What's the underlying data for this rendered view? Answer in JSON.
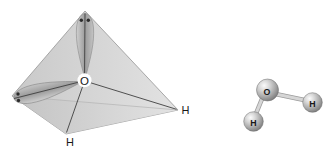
{
  "figure": {
    "description_labels": {
      "tetrahedral_model": {
        "oxygen_label": "O",
        "hydrogen_bottom_label": "H",
        "hydrogen_right_label": "H"
      },
      "ball_and_stick_model": {
        "oxygen_label": "O",
        "hydrogen_left_label": "H",
        "hydrogen_right_label": "H"
      }
    },
    "colors": {
      "background": "#ffffff",
      "face_left": "#c9c9c9",
      "face_right": "#e2e2e2",
      "face_lower_left": "#c2c2c2",
      "face_lower_right": "#e3e3e3",
      "edge": "#969696",
      "back_edge": "#b3b3b3",
      "bond_line": "#3f3f3f",
      "lobe_edge_light": "#d0d0d0",
      "lobe_core": "#9b9b9b",
      "lobe_edge_dark": "#c4c4c4",
      "lobe_outline": "#8a8a8a",
      "electron_dot": "#2c2c2c",
      "label": "#181818",
      "sphere_highlight": "#fbfbfb",
      "sphere_light": "#d9d9d9",
      "sphere_mid": "#a9a9a9",
      "sphere_dark": "#747474",
      "sphere_rim": "#6d6d6d",
      "stick_fill": "#d6d6d6",
      "stick_outline": "#9c9c9c"
    }
  }
}
